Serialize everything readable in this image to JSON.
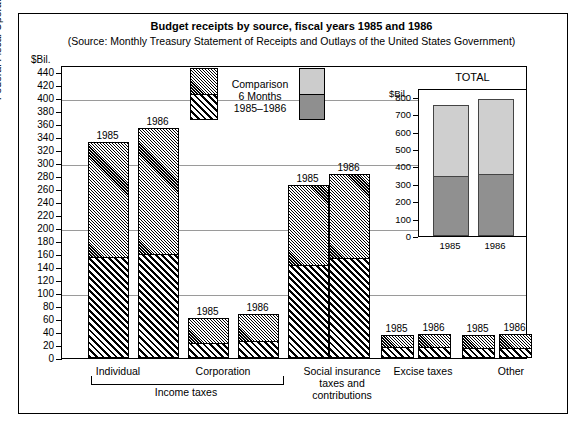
{
  "title": "Budget receipts by source, fiscal years 1985 and 1986",
  "subtitle": "(Source:  Monthly Treasury Statement of Receipts and Outlays of the United States Government)",
  "axis": {
    "unit_main": "$Bil.",
    "unit_inset": "$Bil.",
    "ylabel": "Federal Fiscal Operations",
    "yticks_main": [
      "440",
      "420",
      "400",
      "380",
      "360",
      "340",
      "320",
      "300",
      "280",
      "260",
      "240",
      "220",
      "200",
      "180",
      "160",
      "140",
      "120",
      "100",
      "80",
      "60",
      "40",
      "20",
      "0"
    ],
    "yticks_inset": [
      "800",
      "700",
      "600",
      "500",
      "400",
      "300",
      "200",
      "100",
      "0"
    ]
  },
  "legend": {
    "line1": "Comparison",
    "line2": "6 Months",
    "line3": "1985–1986",
    "hatch_swatch_name": "hatched-bar-sample",
    "solid_swatch_name": "solid-bar-sample"
  },
  "inset": {
    "title": "TOTAL",
    "labels": [
      "1985",
      "1986"
    ]
  },
  "groups": [
    {
      "label": "Individual",
      "years": [
        "1985",
        "1986"
      ]
    },
    {
      "label": "Corporation",
      "years": [
        "1985",
        "1986"
      ]
    },
    {
      "label": "Social insurance\ntaxes and\ncontributions",
      "years": [
        "1985",
        "1986"
      ]
    },
    {
      "label": "Excise taxes",
      "years": [
        "1985",
        "1986"
      ]
    },
    {
      "label": "Other",
      "years": [
        "1985",
        "1986"
      ]
    }
  ],
  "bracket_label": "Income taxes",
  "group_labels": {
    "individual": "Individual",
    "corporation": "Corporation",
    "social_l1": "Social insurance",
    "social_l2": "taxes and",
    "social_l3": "contributions",
    "excise": "Excise taxes",
    "other": "Other"
  },
  "chart_data": {
    "type": "bar",
    "title": "Budget receipts by source, fiscal years 1985 and 1986",
    "subtitle": "(Source:  Monthly Treasury Statement of Receipts and Outlays of the United States Government)",
    "ylabel": "Federal Fiscal Operations",
    "xlabel": "",
    "yunit": "$Bil.",
    "ylim": [
      0,
      450
    ],
    "ytick_step": 20,
    "grid": true,
    "stacked": true,
    "legend_position": "top-center",
    "legend_entries": [
      "Comparison 6 Months 1985–1986"
    ],
    "categories": [
      "Individual 1985",
      "Individual 1986",
      "Corporation 1985",
      "Corporation 1986",
      "Social insurance 1985",
      "Social insurance 1986",
      "Excise taxes 1985",
      "Excise taxes 1986",
      "Other 1985",
      "Other 1986"
    ],
    "series": [
      {
        "name": "6 Months (lower segment)",
        "pattern": "coarse-diagonal-hatch",
        "values": [
          157,
          162,
          25,
          27,
          145,
          155,
          18,
          18,
          17,
          17
        ]
      },
      {
        "name": "Remainder of fiscal year (upper segment)",
        "pattern": "fine-diagonal-hatch",
        "values": [
          174,
          191,
          36,
          41,
          120,
          128,
          17,
          19,
          18,
          20
        ]
      }
    ],
    "totals": [
      331,
      353,
      61,
      68,
      265,
      283,
      35,
      37,
      35,
      37
    ],
    "inset": {
      "type": "bar",
      "title": "TOTAL",
      "stacked": true,
      "yunit": "$Bil.",
      "ylim": [
        0,
        850
      ],
      "ytick_step": 100,
      "categories": [
        "1985",
        "1986"
      ],
      "series": [
        {
          "name": "6 Months",
          "color": "#909090",
          "values": [
            348,
            360
          ]
        },
        {
          "name": "Remainder",
          "color": "#cfcfcf",
          "values": [
            407,
            425
          ]
        }
      ],
      "totals": [
        755,
        785
      ]
    }
  }
}
